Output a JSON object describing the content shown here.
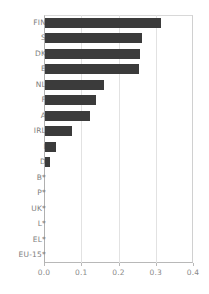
{
  "chart_data": {
    "type": "bar",
    "orientation": "horizontal",
    "title": "",
    "subtitle": "",
    "xlabel": "",
    "ylabel": "",
    "xlim": [
      0.0,
      0.4
    ],
    "ylim": null,
    "grid": true,
    "grid_axis": "x",
    "legend": false,
    "legend_position": "none",
    "bar_color": "#3b3b3b",
    "categories": [
      "FIN",
      "S",
      "DK",
      "E",
      "NL",
      "F",
      "A",
      "IRL",
      "I",
      "D",
      "B*",
      "P*",
      "UK*",
      "L*",
      "EL*",
      "EU-15*"
    ],
    "values": [
      0.314,
      0.263,
      0.259,
      0.255,
      0.161,
      0.139,
      0.123,
      0.075,
      0.032,
      0.016,
      0.0,
      0.0,
      0.0,
      0.0,
      0.0,
      0.0
    ],
    "xticks": [
      0.0,
      0.1,
      0.2,
      0.3,
      0.4
    ],
    "xticklabels": [
      "0.0",
      "0.1",
      "0.2",
      "0.3",
      "0.4"
    ],
    "annotations": []
  },
  "axis": {
    "tick_color": "#8a8a8a",
    "grid_color": "#e2e2e2",
    "frame_color": "#c8c8c8"
  }
}
